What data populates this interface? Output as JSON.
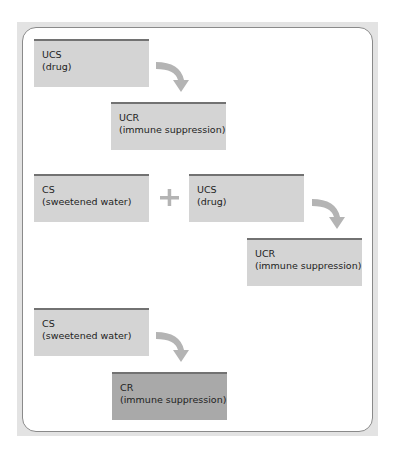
{
  "colors": {
    "frame": "#e3e3e3",
    "box_fill": "#d4d4d4",
    "box_fill_dark": "#a9a9a9",
    "box_top_border": "#727272",
    "arrow": "#b4b4b4"
  },
  "rows": [
    {
      "boxes": [
        {
          "label": "UCS",
          "sub": "(drug)"
        },
        {
          "label": "UCR",
          "sub": "(immune suppression)"
        }
      ]
    },
    {
      "boxes": [
        {
          "label": "CS",
          "sub": "(sweetened water)"
        },
        {
          "label": "UCS",
          "sub": "(drug)"
        },
        {
          "label": "UCR",
          "sub": "(immune suppression)"
        }
      ],
      "operator": "+"
    },
    {
      "boxes": [
        {
          "label": "CS",
          "sub": "(sweetened water)"
        },
        {
          "label": "CR",
          "sub": "(immune suppression)"
        }
      ]
    }
  ]
}
